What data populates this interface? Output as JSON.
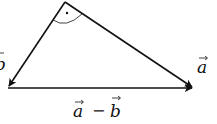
{
  "diagram": {
    "type": "vector-triangle",
    "vertices": {
      "apex": {
        "x": 65,
        "y": 2
      },
      "left": {
        "x": 8,
        "y": 88
      },
      "right": {
        "x": 194,
        "y": 88
      }
    },
    "vectors": [
      {
        "name": "b",
        "label": "b",
        "from": "apex",
        "to": "left"
      },
      {
        "name": "a",
        "label": "a",
        "from": "apex",
        "to": "right"
      },
      {
        "name": "a-minus-b",
        "label_left": "a",
        "operator": "−",
        "label_right": "b",
        "from": "left",
        "to": "right"
      }
    ],
    "right_angle_marker": {
      "at": "apex",
      "style": "arc-with-dot"
    },
    "colors": {
      "stroke": "#111111",
      "background": "#ffffff"
    }
  }
}
